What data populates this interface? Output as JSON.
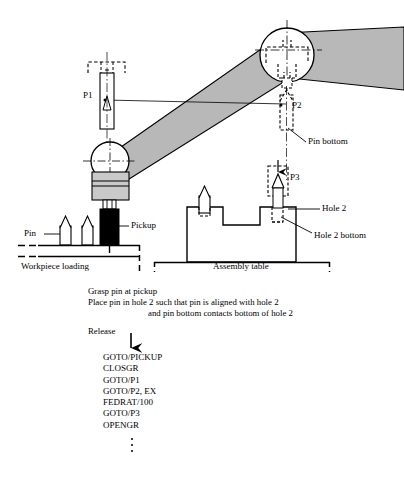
{
  "figure": {
    "type": "technical-diagram",
    "callouts": [
      {
        "id": "p1",
        "label": "P1",
        "x": 83,
        "y": 97
      },
      {
        "id": "p2",
        "label": "P2",
        "x": 292,
        "y": 107
      },
      {
        "id": "p3",
        "label": "P3",
        "x": 288,
        "y": 180
      },
      {
        "id": "pin",
        "label": "Pin",
        "x": 27,
        "y": 231
      },
      {
        "id": "pickup",
        "label": "Pickup",
        "x": 131,
        "y": 222
      },
      {
        "id": "pin-bottom",
        "label": "Pin bottom",
        "x": 308,
        "y": 140
      },
      {
        "id": "hole-2",
        "label": "Hole 2",
        "x": 322,
        "y": 207
      },
      {
        "id": "hole-2-bottom",
        "label": "Hole 2 bottom",
        "x": 314,
        "y": 235
      },
      {
        "id": "workpiece-loading",
        "label": "Workpiece loading",
        "x": 21,
        "y": 258
      },
      {
        "id": "assembly-table",
        "label": "Assembly table",
        "x": 216,
        "y": 258
      }
    ],
    "instructions": [
      "Grasp pin at pickup",
      "Place pin in hole 2 such that pin is aligned with hole 2",
      "and pin bottom contacts bottom of hole 2",
      "Release"
    ],
    "program": [
      "GOTO/PICKUP",
      "CLOSGR",
      "GOTO/P1",
      "GOTO/P2, EX",
      "FEDRAT/100",
      "GOTO/P3",
      "OPENGR"
    ],
    "continuation_dots": 3,
    "colors": {
      "ink": "#000000",
      "arm_fill": "#b8b8b8",
      "gripper_fill": "#c9c9c9",
      "pickup_fill": "#000000",
      "paper": "#ffffff"
    }
  }
}
